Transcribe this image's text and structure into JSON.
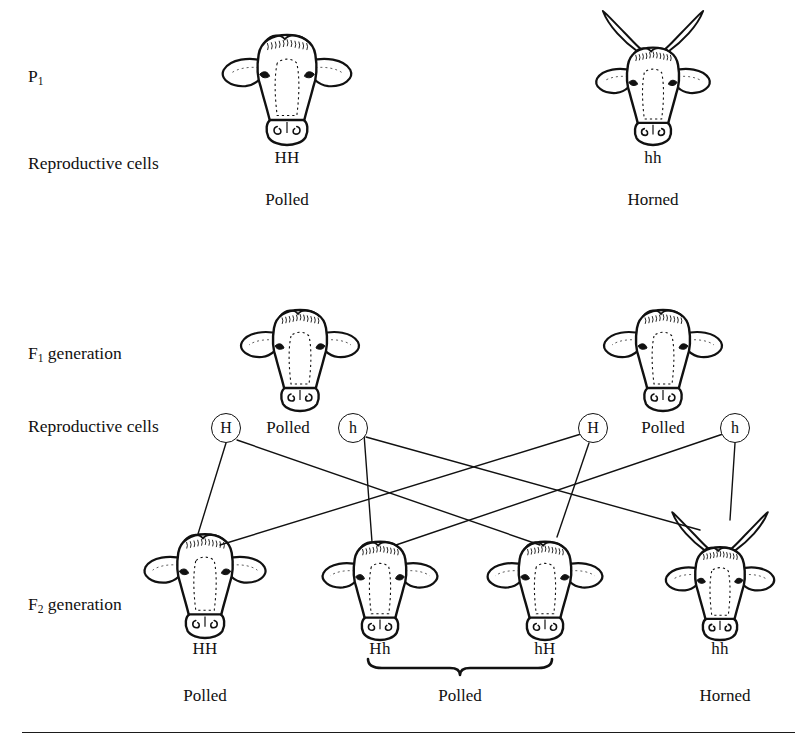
{
  "diagram": {
    "row_labels": [
      {
        "name": "p1",
        "text_main": "P",
        "text_sub": "1",
        "x": 28,
        "y": 78
      },
      {
        "name": "reproductive-cells-p1",
        "text_main": "Reproductive cells",
        "text_sub": "",
        "x": 28,
        "y": 165
      },
      {
        "name": "f1-generation",
        "text_main": "F",
        "text_sub": "1",
        "suffix": " generation",
        "x": 28,
        "y": 355
      },
      {
        "name": "reproductive-cells-f1",
        "text_main": "Reproductive cells",
        "text_sub": "",
        "x": 28,
        "y": 428
      },
      {
        "name": "f2-generation",
        "text_main": "F",
        "text_sub": "2",
        "suffix": " generation",
        "x": 28,
        "y": 606
      }
    ],
    "p1": {
      "parents": [
        {
          "name": "p1-parent-polled",
          "genotype": "HH",
          "phenotype": "Polled",
          "horned": false,
          "x": 287,
          "head_y": 20,
          "geno_y": 158,
          "pheno_y": 200
        },
        {
          "name": "p1-parent-horned",
          "genotype": "hh",
          "phenotype": "Horned",
          "horned": true,
          "x": 653,
          "head_y": 8,
          "geno_y": 158,
          "pheno_y": 200
        }
      ]
    },
    "f1": {
      "offspring": [
        {
          "name": "f1-offspring-left",
          "phenotype": "Polled",
          "horned": false,
          "x": 300,
          "head_y": 296
        },
        {
          "name": "f1-offspring-right",
          "phenotype": "Polled",
          "horned": false,
          "x": 663,
          "head_y": 296
        }
      ],
      "gametes": [
        {
          "name": "gamete-f1-left-H",
          "allele": "H",
          "x": 226,
          "y": 428
        },
        {
          "name": "gamete-f1-left-h",
          "allele": "h",
          "x": 353,
          "y": 428
        },
        {
          "name": "gamete-f1-right-H",
          "allele": "H",
          "x": 593,
          "y": 428
        },
        {
          "name": "gamete-f1-right-h",
          "allele": "h",
          "x": 735,
          "y": 428
        }
      ],
      "gamete_phenotype_labels": [
        {
          "name": "f1-phenotype-left",
          "text": "Polled",
          "x": 288,
          "y": 428
        },
        {
          "name": "f1-phenotype-right",
          "text": "Polled",
          "x": 663,
          "y": 428
        }
      ]
    },
    "f2": {
      "offspring": [
        {
          "name": "f2-offspring-HH",
          "genotype": "HH",
          "horned": false,
          "x": 205,
          "head_y": 520,
          "geno_y": 648
        },
        {
          "name": "f2-offspring-Hh",
          "genotype": "Hh",
          "horned": false,
          "x": 380,
          "head_y": 528,
          "geno_y": 648
        },
        {
          "name": "f2-offspring-hH",
          "genotype": "hH",
          "horned": false,
          "x": 545,
          "head_y": 528,
          "geno_y": 648
        },
        {
          "name": "f2-offspring-hh",
          "genotype": "hh",
          "horned": true,
          "x": 720,
          "head_y": 508,
          "geno_y": 648
        }
      ],
      "phenotype_labels": [
        {
          "name": "f2-phenotype-polled-left",
          "text": "Polled",
          "x": 205,
          "y": 695
        },
        {
          "name": "f2-phenotype-polled-middle",
          "text": "Polled",
          "x": 460,
          "y": 695
        },
        {
          "name": "f2-phenotype-horned-right",
          "text": "Horned",
          "x": 725,
          "y": 695
        }
      ],
      "brace": {
        "name": "f2-brace-polled",
        "x_start": 368,
        "x_end": 552,
        "y": 668
      }
    },
    "cross_lines": [
      {
        "name": "cross-line-H1-to-HH",
        "x1": 226,
        "y1": 443,
        "x2": 198,
        "y2": 534
      },
      {
        "name": "cross-line-H1-to-hH",
        "x1": 237,
        "y1": 440,
        "x2": 540,
        "y2": 545
      },
      {
        "name": "cross-line-h1-to-Hh",
        "x1": 364,
        "y1": 434,
        "x2": 372,
        "y2": 542
      },
      {
        "name": "cross-line-h1-to-hh",
        "x1": 366,
        "y1": 437,
        "x2": 700,
        "y2": 530
      },
      {
        "name": "cross-line-H2-to-HH",
        "x1": 581,
        "y1": 434,
        "x2": 220,
        "y2": 545
      },
      {
        "name": "cross-line-H2-to-hH",
        "x1": 589,
        "y1": 443,
        "x2": 557,
        "y2": 537
      },
      {
        "name": "cross-line-h2-to-Hh",
        "x1": 723,
        "y1": 434,
        "x2": 396,
        "y2": 545
      },
      {
        "name": "cross-line-h2-to-hh",
        "x1": 735,
        "y1": 443,
        "x2": 730,
        "y2": 520
      }
    ],
    "footer_rule": {
      "name": "footer-divider",
      "x": 22,
      "y": 732,
      "width": 773
    },
    "colors": {
      "ink": "#111111",
      "background": "#ffffff",
      "rule": "#1b1b1b"
    }
  }
}
